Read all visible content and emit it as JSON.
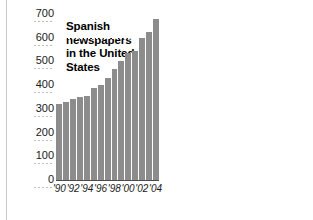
{
  "chart_data": [
    {
      "type": "bar",
      "title": "Spanish newspapers in the United States",
      "xlabel": "",
      "ylabel": "",
      "ylim": [
        0,
        700
      ],
      "yticks": [
        0,
        100,
        200,
        300,
        400,
        500,
        600,
        700
      ],
      "ytick_labels": [
        "0",
        "100",
        "200",
        "300",
        "400",
        "500",
        "600",
        "700"
      ],
      "grid": true,
      "legend": "none",
      "categories": [
        "'90",
        "'91",
        "'92",
        "'93",
        "'94",
        "'95",
        "'96",
        "'97",
        "'98",
        "'99",
        "'00",
        "'01",
        "'02",
        "'03",
        "'04"
      ],
      "xtick_labels": [
        "'90",
        "'92",
        "'94",
        "'96",
        "'98",
        "'00",
        "'02",
        "'04"
      ],
      "values": [
        320,
        330,
        340,
        350,
        355,
        390,
        400,
        430,
        470,
        500,
        535,
        545,
        600,
        625,
        680
      ]
    },
    {
      "type": "bar",
      "title": "Ad revenue",
      "xlabel": "",
      "ylabel": "$800 million",
      "ylim": [
        0,
        800
      ],
      "yticks": [
        0,
        200,
        400,
        600,
        800
      ],
      "ytick_labels": [
        "0",
        "200",
        "400",
        "600",
        "$800 million"
      ],
      "grid": true,
      "legend": "none",
      "categories": [
        "'90",
        "'91",
        "'92",
        "'93",
        "'94",
        "'95",
        "'96",
        "'97",
        "'98",
        "'99",
        "'00",
        "'01",
        "'02",
        "'03"
      ],
      "xtick_labels": [
        "'90",
        "'92",
        "'94",
        "'96",
        "'98",
        "'00",
        "'02"
      ],
      "values": [
        95,
        125,
        150,
        175,
        195,
        215,
        270,
        320,
        385,
        450,
        540,
        620,
        700,
        790
      ]
    }
  ],
  "left_chart": {
    "title": "Spanish newspapers in the United States",
    "y_labels": [
      "700",
      "600",
      "500",
      "400",
      "300",
      "200",
      "100",
      "0"
    ],
    "x_labels": [
      "'90",
      "'92",
      "'94",
      "'96",
      "'98",
      "'00",
      "'02",
      "'04"
    ]
  },
  "right_chart": {
    "title": "Ad revenue",
    "y_labels": [
      "$800 million",
      "600",
      "400",
      "200",
      "0"
    ],
    "x_labels": [
      "'90",
      "'92",
      "'94",
      "'96",
      "'98",
      "'00",
      "'02"
    ]
  },
  "colors": {
    "bar": "#8c8c8c",
    "gridline": "#ffffff",
    "axis": "#4a4a4a",
    "text": "#1a1a1a",
    "background": "#ffffff"
  }
}
